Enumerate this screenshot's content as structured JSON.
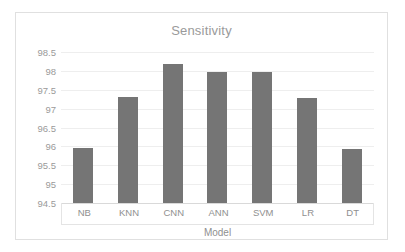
{
  "chart_data": {
    "type": "bar",
    "title": "Sensitivity",
    "xlabel": "Model",
    "ylabel": "",
    "categories": [
      "NB",
      "KNN",
      "CNN",
      "ANN",
      "SVM",
      "LR",
      "DT"
    ],
    "values": [
      95.95,
      97.3,
      98.17,
      97.97,
      97.96,
      97.27,
      95.92
    ],
    "ylim": [
      94.5,
      98.5
    ],
    "ytick_step": 0.5,
    "yticks": [
      "98.5",
      "98",
      "97.5",
      "97",
      "96.5",
      "96",
      "95.5",
      "95",
      "94.5"
    ],
    "ytick_values": [
      98.5,
      98,
      97.5,
      97,
      96.5,
      96,
      95.5,
      95,
      94.5
    ],
    "grid": true,
    "legend": false,
    "legend_position": "none",
    "series": [
      {
        "name": "Sensitivity",
        "values": [
          95.95,
          97.3,
          98.17,
          97.97,
          97.96,
          97.27,
          95.92
        ],
        "color": "#757575"
      }
    ]
  },
  "style": {
    "bar_color": "#757575",
    "grid_color": "#eeeeee",
    "axis_color": "#d9d9d9",
    "text_color": "#9a9a9a",
    "border_color": "#e0e0e0",
    "background": "#ffffff"
  }
}
